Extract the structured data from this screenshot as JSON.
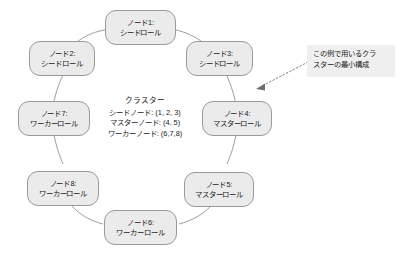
{
  "diagram": {
    "background_color": "#ffffff",
    "node_fill_color": "#ebebeb",
    "node_border_color": "#9a9a9a",
    "edge_color": "#8c8c8c",
    "text_color": "#1a1a1a",
    "callout_fill_color": "#efefef",
    "nodes": [
      {
        "id": "node1",
        "name": "ノード1:",
        "role": "シードロール"
      },
      {
        "id": "node2",
        "name": "ノード2:",
        "role": "シードロール"
      },
      {
        "id": "node3",
        "name": "ノード3:",
        "role": "シードロール"
      },
      {
        "id": "node4",
        "name": "ノード4:",
        "role": "マスターロール"
      },
      {
        "id": "node5",
        "name": "ノード5:",
        "role": "マスターロール"
      },
      {
        "id": "node6",
        "name": "ノード6:",
        "role": "ワーカーロール"
      },
      {
        "id": "node7",
        "name": "ノード7:",
        "role": "ワーカーロール"
      },
      {
        "id": "node8",
        "name": "ノード8:",
        "role": "ワーカーロール"
      }
    ],
    "center": {
      "title": "クラスター",
      "lines": [
        "シードノード: (1, 2, 3)",
        "マスターノード: (4, 5)",
        "ワーカーノード: (6,7,8)"
      ]
    },
    "callout": {
      "line1": "この例で用いるクラ",
      "line2": "スターの最小構成"
    }
  }
}
